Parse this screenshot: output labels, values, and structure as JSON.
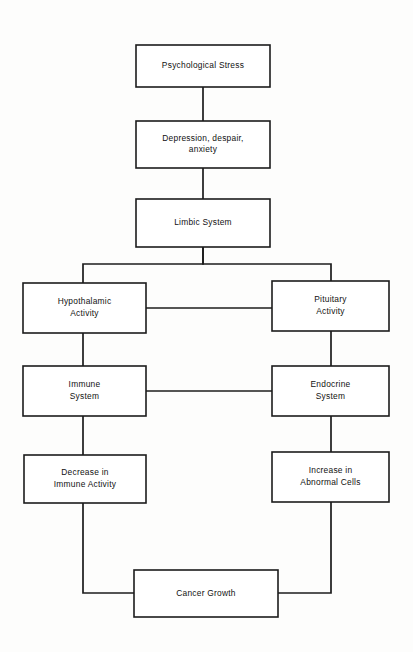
{
  "diagram": {
    "colors": {
      "background": "#fdfdfc",
      "box_fill": "#ffffff",
      "stroke": "#1c1c1c",
      "text": "#111111"
    },
    "nodes": [
      {
        "id": "psychological-stress",
        "lines": [
          "Psychological Stress"
        ],
        "x": 136,
        "y": 45,
        "w": 134,
        "h": 42
      },
      {
        "id": "depression-despair-anxiety",
        "lines": [
          "Depression, despair,",
          "anxiety"
        ],
        "x": 136,
        "y": 121,
        "w": 134,
        "h": 47
      },
      {
        "id": "limbic-system",
        "lines": [
          "Limbic System"
        ],
        "x": 136,
        "y": 199,
        "w": 134,
        "h": 48
      },
      {
        "id": "hypothalamic-activity",
        "lines": [
          "Hypothalamic",
          "Activity"
        ],
        "x": 23,
        "y": 283,
        "w": 123,
        "h": 50
      },
      {
        "id": "pituitary-activity",
        "lines": [
          "Pituitary",
          "Activity"
        ],
        "x": 272,
        "y": 281,
        "w": 117,
        "h": 50
      },
      {
        "id": "immune-system",
        "lines": [
          "Immune",
          "System"
        ],
        "x": 23,
        "y": 366,
        "w": 123,
        "h": 50
      },
      {
        "id": "endocrine-system",
        "lines": [
          "Endocrine",
          "System"
        ],
        "x": 272,
        "y": 366,
        "w": 117,
        "h": 50
      },
      {
        "id": "decrease-in-immune-activity",
        "lines": [
          "Decrease in",
          "Immune Activity"
        ],
        "x": 24,
        "y": 455,
        "w": 122,
        "h": 48
      },
      {
        "id": "increase-in-abnormal-cells",
        "lines": [
          "Increase in",
          "Abnormal Cells"
        ],
        "x": 272,
        "y": 452,
        "w": 117,
        "h": 50
      },
      {
        "id": "cancer-growth",
        "lines": [
          "Cancer Growth"
        ],
        "x": 134,
        "y": 570,
        "w": 144,
        "h": 47
      }
    ],
    "connectors": [
      {
        "id": "stress-to-depression",
        "from": "psychological-stress",
        "to": "depression-despair-anxiety",
        "path": "M 203 87 L 203 121"
      },
      {
        "id": "depression-to-limbic",
        "from": "depression-despair-anxiety",
        "to": "limbic-system",
        "path": "M 203 168 L 203 199"
      },
      {
        "id": "limbic-to-hypothalamic",
        "from": "limbic-system",
        "to": "hypothalamic-activity",
        "path": "M 203 247 L 203 264 L 83 264 L 83 283"
      },
      {
        "id": "limbic-to-pituitary",
        "from": "limbic-system",
        "to": "pituitary-activity",
        "path": "M 203 247 L 203 264 L 331 264 L 331 281"
      },
      {
        "id": "hypothalamic-to-pituitary",
        "from": "hypothalamic-activity",
        "to": "pituitary-activity",
        "path": "M 146 308 L 272 308"
      },
      {
        "id": "hypothalamic-to-immune",
        "from": "hypothalamic-activity",
        "to": "immune-system",
        "path": "M 83 333 L 83 366"
      },
      {
        "id": "pituitary-to-endocrine",
        "from": "pituitary-activity",
        "to": "endocrine-system",
        "path": "M 331 331 L 331 366"
      },
      {
        "id": "immune-to-endocrine",
        "from": "immune-system",
        "to": "endocrine-system",
        "path": "M 146 391 L 272 391"
      },
      {
        "id": "immune-to-decrease",
        "from": "immune-system",
        "to": "decrease-in-immune-activity",
        "path": "M 83 416 L 83 455"
      },
      {
        "id": "endocrine-to-increase",
        "from": "endocrine-system",
        "to": "increase-in-abnormal-cells",
        "path": "M 331 416 L 331 452"
      },
      {
        "id": "decrease-to-cancer",
        "from": "decrease-in-immune-activity",
        "to": "cancer-growth",
        "path": "M 83 503 L 83 593 L 134 593"
      },
      {
        "id": "increase-to-cancer",
        "from": "increase-in-abnormal-cells",
        "to": "cancer-growth",
        "path": "M 331 502 L 331 593 L 278 593"
      }
    ]
  }
}
